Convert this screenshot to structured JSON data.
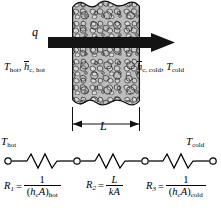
{
  "figure": {
    "type": "heat-transfer-schematic"
  },
  "upper": {
    "heat_flux_label": "q",
    "arrow_name": "heat-flow-arrow",
    "wall_name": "plane-wall",
    "left_side": {
      "temperature": "T",
      "temperature_sub": "hot",
      "separator": ",",
      "coefficient": "h",
      "coefficient_sub": "c, hot"
    },
    "right_side": {
      "coefficient": "h",
      "coefficient_sub": "c, cold",
      "separator": ",",
      "temperature": "T",
      "temperature_sub": "cold"
    },
    "thickness_label": "L"
  },
  "network": {
    "left_terminal": "T",
    "left_terminal_sub": "hot",
    "right_terminal": "T",
    "right_terminal_sub": "cold",
    "node_count": 4,
    "resistor_count": 3
  },
  "formulas": [
    {
      "lhs": "R",
      "lhs_sub": "1",
      "equals": "=",
      "numerator": "1",
      "denominator_open": "(",
      "denominator_h": "h",
      "denominator_hsub": "c",
      "denominator_A": "A",
      "denominator_close": ")",
      "denominator_sub": "hot"
    },
    {
      "lhs": "R",
      "lhs_sub": "2",
      "equals": "=",
      "numerator": "L",
      "denominator_k": "k",
      "denominator_A": "A"
    },
    {
      "lhs": "R",
      "lhs_sub": "3",
      "equals": "=",
      "numerator": "1",
      "denominator_open": "(",
      "denominator_h": "h",
      "denominator_hsub": "c",
      "denominator_A": "A",
      "denominator_close": ")",
      "denominator_sub": "cold"
    }
  ],
  "colors": {
    "wall_fill": "#b9b9b9",
    "wall_outline": "#1a1a1a",
    "arrow": "#141414",
    "line": "#000000",
    "background": "#ffffff"
  }
}
